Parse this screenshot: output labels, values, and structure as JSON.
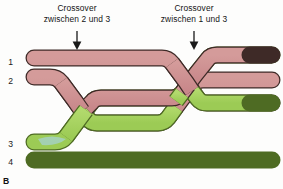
{
  "figure": {
    "panel_label": "B",
    "background_color": "#fdfdfc"
  },
  "annotations": [
    {
      "id": "crossover-2-3",
      "line1": "Crossover",
      "line2": "zwischen 2 und 3",
      "arrow_x": 77,
      "arrow_top": 31,
      "arrow_bottom": 50
    },
    {
      "id": "crossover-1-3",
      "line1": "Crossover",
      "line2": "zwischen 1 und 3",
      "arrow_x": 194,
      "arrow_top": 31,
      "arrow_bottom": 50
    }
  ],
  "strands": [
    {
      "number": "1",
      "color_name": "rose",
      "color": "#cf8f90"
    },
    {
      "number": "2",
      "color_name": "rose",
      "color": "#cf8f90"
    },
    {
      "number": "3",
      "color_name": "green",
      "color": "#a6d361"
    },
    {
      "number": "4",
      "color_name": "green",
      "color": "#a6d361"
    }
  ],
  "colors": {
    "rose_fill": "#cf8f90",
    "green_fill": "#a6d361",
    "rose_stroke": "#3e2a27",
    "green_stroke": "#4e6b23",
    "arrow": "#1a1a1a",
    "text": "#141414",
    "blue_artifact": "#a8d4ea"
  }
}
